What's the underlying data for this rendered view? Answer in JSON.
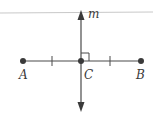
{
  "diagram": {
    "type": "perpendicular-bisector",
    "line_label": "m",
    "points": [
      {
        "id": "A",
        "label": "A"
      },
      {
        "id": "C",
        "label": "C"
      },
      {
        "id": "B",
        "label": "B"
      }
    ],
    "annotations": {
      "congruent_ticks": [
        "AC",
        "CB"
      ],
      "right_angle_at": "C"
    },
    "colors": {
      "stroke": "#4a4a4a",
      "point": "#3a3a3a",
      "top_rule": "#c8c8c8",
      "background": "#ffffff"
    }
  }
}
